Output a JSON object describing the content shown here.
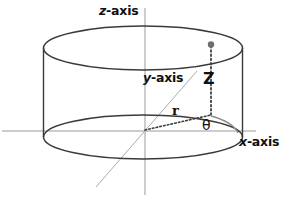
{
  "figure": {
    "type": "diagram",
    "background_color": "#ffffff",
    "width": 283,
    "height": 203
  },
  "colors": {
    "outline": "#3a3a3a",
    "axis_line": "#9a9a9a",
    "y_axis_line": "#a8a8a8",
    "dotted": "#4a4a4a",
    "point_marker": "#6e6e6e",
    "text": "#101010",
    "arc": "#8c8c8c"
  },
  "labels": {
    "z_axis": {
      "variable": "z",
      "suffix": "-axis"
    },
    "y_axis": {
      "variable": "y",
      "suffix": "-axis"
    },
    "x_axis": {
      "variable": "x",
      "suffix": "-axis"
    },
    "height": "Z",
    "radius": "r",
    "angle": "θ"
  },
  "geometry": {
    "cylinder": {
      "left_x": 43,
      "right_x": 243,
      "top_center_y": 48,
      "bottom_center_y": 137,
      "ellipse_rx": 100,
      "ellipse_ry": 22
    },
    "origin": {
      "x": 145,
      "y": 131
    },
    "point": {
      "x": 211,
      "y": 44
    },
    "foot": {
      "x": 211,
      "y": 115
    },
    "z_axis_line": {
      "x": 145,
      "y1": 8,
      "y2": 195
    },
    "x_axis_line": {
      "x1": 2,
      "x2": 256,
      "y": 131
    },
    "y_axis_line": {
      "x1": 96,
      "y1": 186,
      "x2": 197,
      "y2": 71
    }
  }
}
